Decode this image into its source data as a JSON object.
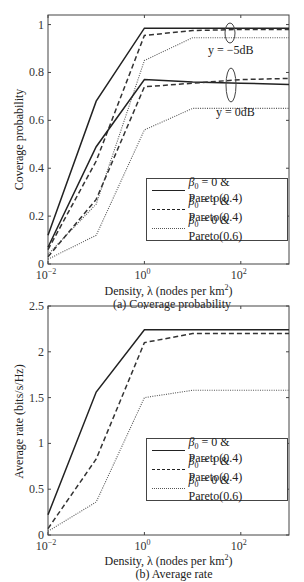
{
  "chart_data": [
    {
      "type": "line",
      "title": "",
      "caption": "(a) Coverage probability",
      "xlabel": "Density, λ (nodes per km²)",
      "ylabel": "Coverage probability",
      "xscale": "log",
      "xlim": [
        0.01,
        1000
      ],
      "ylim": [
        0,
        1.04
      ],
      "xticks": [
        "10⁻²",
        "10⁰",
        "10²"
      ],
      "yticks": [
        "0",
        "0.2",
        "0.4",
        "0.6",
        "0.8",
        "1"
      ],
      "grid": false,
      "legend_position": "lower right",
      "x": [
        0.01,
        0.1,
        1,
        10,
        100,
        1000
      ],
      "annotations": [
        "y = −5dB",
        "y = 0dB"
      ],
      "series": [
        {
          "name": "β0 = 0 & Pareto(0.4)",
          "group": "y = −5dB",
          "style": "solid",
          "values": [
            0.12,
            0.68,
            0.985,
            0.985,
            0.985,
            0.985
          ]
        },
        {
          "name": "β0 = 1 & Pareto(0.4)",
          "group": "y = −5dB",
          "style": "dashed",
          "values": [
            0.06,
            0.43,
            0.955,
            0.975,
            0.98,
            0.98
          ]
        },
        {
          "name": "β0 = 0 & Pareto(0.6)",
          "group": "y = −5dB",
          "style": "dotted",
          "values": [
            0.04,
            0.25,
            0.85,
            0.945,
            0.945,
            0.945
          ]
        },
        {
          "name": "β0 = 0 & Pareto(0.4)",
          "group": "y = 0dB",
          "style": "solid",
          "values": [
            0.07,
            0.49,
            0.77,
            0.76,
            0.755,
            0.75
          ]
        },
        {
          "name": "β0 = 1 & Pareto(0.4)",
          "group": "y = 0dB",
          "style": "dashed",
          "values": [
            0.03,
            0.27,
            0.74,
            0.755,
            0.77,
            0.775
          ]
        },
        {
          "name": "β0 = 0 & Pareto(0.6)",
          "group": "y = 0dB",
          "style": "dotted",
          "values": [
            0.02,
            0.12,
            0.56,
            0.65,
            0.65,
            0.65
          ]
        }
      ]
    },
    {
      "type": "line",
      "title": "",
      "caption": "(b) Average rate",
      "xlabel": "Density, λ (nodes per km²)",
      "ylabel": "Average rate (bits/s/Hz)",
      "xscale": "log",
      "xlim": [
        0.01,
        1000
      ],
      "ylim": [
        0,
        2.5
      ],
      "xticks": [
        "10⁻²",
        "10⁰",
        "10²"
      ],
      "yticks": [
        "0",
        "0.5",
        "1",
        "1.5",
        "2",
        "2.5"
      ],
      "grid": false,
      "legend_position": "lower right",
      "x": [
        0.01,
        0.1,
        1,
        10,
        100,
        1000
      ],
      "series": [
        {
          "name": "β0 = 0 & Pareto(0.4)",
          "style": "solid",
          "values": [
            0.22,
            1.56,
            2.24,
            2.24,
            2.24,
            2.24
          ]
        },
        {
          "name": "β0 = 1 & Pareto(0.4)",
          "style": "dashed",
          "values": [
            0.07,
            0.83,
            2.1,
            2.2,
            2.2,
            2.2
          ]
        },
        {
          "name": "β0 = 0 & Pareto(0.6)",
          "style": "dotted",
          "values": [
            0.04,
            0.36,
            1.5,
            1.58,
            1.58,
            1.58
          ]
        }
      ]
    }
  ],
  "figA": {
    "caption": "(a) Coverage probability",
    "xlabel_pre": "Density, λ (nodes per km",
    "xlabel_sup": "2",
    "xlabel_post": ")",
    "ylabel": "Coverage probability",
    "annot_top": "y = −5dB",
    "annot_bottom": "y = 0dB",
    "legend": [
      {
        "beta": "0",
        "pareto": "Pareto(0.4)"
      },
      {
        "beta": "1",
        "pareto": "Pareto(0.4)"
      },
      {
        "beta": "0",
        "pareto": "Pareto(0.6)"
      }
    ]
  },
  "figB": {
    "caption": "(b) Average rate",
    "xlabel_pre": "Density, λ (nodes per km",
    "xlabel_sup": "2",
    "xlabel_post": ")",
    "ylabel": "Average rate (bits/s/Hz)",
    "legend": [
      {
        "beta": "0",
        "pareto": "Pareto(0.4)"
      },
      {
        "beta": "1",
        "pareto": "Pareto(0.4)"
      },
      {
        "beta": "0",
        "pareto": "Pareto(0.6)"
      }
    ]
  },
  "legend_text": {
    "beta_symbol": "β",
    "beta_sub": "0",
    "eq": " = ",
    "amp": " & "
  }
}
